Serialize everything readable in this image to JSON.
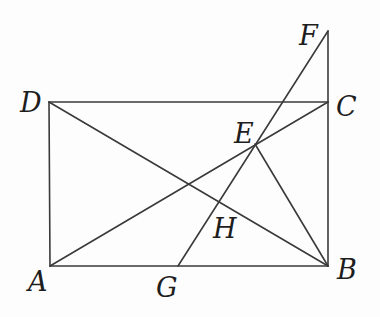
{
  "diagram": {
    "type": "geometry-figure",
    "stroke_color": "#3a3a3a",
    "label_color": "#1e1e1e",
    "points": {
      "A": {
        "label": "A",
        "x": 50,
        "y": 266
      },
      "B": {
        "label": "B",
        "x": 328,
        "y": 266
      },
      "C": {
        "label": "C",
        "x": 328,
        "y": 102
      },
      "D": {
        "label": "D",
        "x": 49,
        "y": 102
      },
      "E": {
        "label": "E",
        "x": 255,
        "y": 144
      },
      "F": {
        "label": "F",
        "x": 328,
        "y": 31
      },
      "G": {
        "label": "G",
        "x": 178,
        "y": 266
      },
      "H": {
        "label": "H",
        "x": 218,
        "y": 202
      }
    },
    "segments": [
      [
        "A",
        "B"
      ],
      [
        "B",
        "C"
      ],
      [
        "C",
        "D"
      ],
      [
        "D",
        "A"
      ],
      [
        "A",
        "C"
      ],
      [
        "D",
        "B"
      ],
      [
        "C",
        "F"
      ],
      [
        "F",
        "G"
      ],
      [
        "E",
        "B"
      ]
    ]
  }
}
